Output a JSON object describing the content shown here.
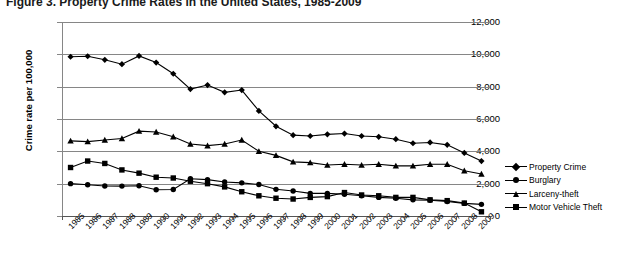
{
  "figure": {
    "title": "Figure 3.  Property Crime Rates in the United States, 1985-2009"
  },
  "legend": {
    "position": "right",
    "items": [
      {
        "label": "Property Crime",
        "marker": "diamond-icon"
      },
      {
        "label": "Burglary",
        "marker": "round-icon"
      },
      {
        "label": "Larceny-theft",
        "marker": "triangle-icon"
      },
      {
        "label": "Motor Vehicle Theft",
        "marker": "square-icon"
      }
    ]
  },
  "chart_data": {
    "type": "line",
    "title": "Figure 3.  Property Crime Rates in the United States, 1985-2009",
    "xlabel": "",
    "ylabel": "Crime rate per 100,000",
    "ylim": [
      0,
      12000
    ],
    "ytick_labels": [
      "0",
      "2,000",
      "4,000",
      "6,000",
      "8,000",
      "10,000",
      "12,000"
    ],
    "ytick_values": [
      0,
      2000,
      4000,
      6000,
      8000,
      10000,
      12000
    ],
    "grid": true,
    "legend_position": "right",
    "x": [
      "1985",
      "1986",
      "1987",
      "1988",
      "1989",
      "1990",
      "1991",
      "1992",
      "1993",
      "1994",
      "1995",
      "1996",
      "1997",
      "1998",
      "1999",
      "2000",
      "2001",
      "2002",
      "2003",
      "2004",
      "2005",
      "2006",
      "2007",
      "2008",
      "2009"
    ],
    "series": [
      {
        "name": "Property Crime",
        "marker": "diamond",
        "values": [
          9850,
          9880,
          9660,
          9390,
          9900,
          9490,
          8800,
          7850,
          8100,
          7650,
          7790,
          6500,
          5550,
          5000,
          4950,
          5050,
          5100,
          4950,
          4900,
          4750,
          4500,
          4550,
          4400,
          3900,
          3400
        ]
      },
      {
        "name": "Burglary",
        "marker": "round",
        "values": [
          2000,
          1930,
          1860,
          1850,
          1870,
          1620,
          1640,
          2300,
          2250,
          2100,
          2050,
          1950,
          1650,
          1550,
          1400,
          1400,
          1350,
          1250,
          1150,
          1100,
          1000,
          970,
          900,
          780,
          720
        ]
      },
      {
        "name": "Larceny-theft",
        "marker": "triangle",
        "values": [
          4650,
          4600,
          4700,
          4790,
          5250,
          5200,
          4900,
          4450,
          4350,
          4450,
          4700,
          4000,
          3750,
          3350,
          3300,
          3150,
          3200,
          3150,
          3200,
          3100,
          3100,
          3200,
          3200,
          2800,
          2600
        ]
      },
      {
        "name": "Motor Vehicle Theft",
        "marker": "square",
        "values": [
          3000,
          3400,
          3250,
          2850,
          2650,
          2400,
          2350,
          2150,
          2000,
          1800,
          1500,
          1250,
          1100,
          1050,
          1150,
          1200,
          1450,
          1300,
          1250,
          1150,
          1150,
          1000,
          950,
          800,
          260
        ]
      }
    ]
  }
}
